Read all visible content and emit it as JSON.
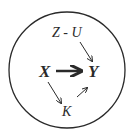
{
  "diagram": {
    "type": "causal-graph",
    "nodes": {
      "zu": "Z - U",
      "x": "X",
      "y": "Y",
      "k": "K"
    },
    "edges": [
      {
        "from": "Z - U",
        "to": "Y",
        "style": "thin"
      },
      {
        "from": "X",
        "to": "Y",
        "style": "bold"
      },
      {
        "from": "X",
        "to": "K",
        "style": "thin"
      },
      {
        "from": "K",
        "to": "Y",
        "style": "thin"
      }
    ],
    "colors": {
      "stroke": "#2a2a2a",
      "background": "#ffffff"
    }
  }
}
